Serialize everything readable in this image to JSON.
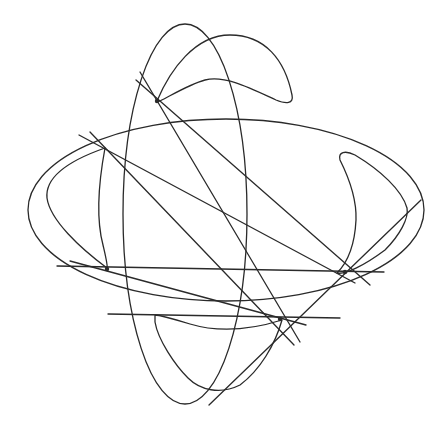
{
  "figure": {
    "width": 448,
    "height": 427,
    "stroke_color": "#2a2a2a",
    "background": "#ffffff"
  },
  "shapes": {
    "ellipses": [
      {
        "name": "vertical-ellipse",
        "cx": 185,
        "cy": 214,
        "rx": 62,
        "ry": 190
      },
      {
        "name": "horizontal-ellipse",
        "cx": 226,
        "cy": 210,
        "rx": 198,
        "ry": 91
      }
    ],
    "curves": [
      {
        "name": "top-crescent",
        "d": "M157,101 C170,70 195,35 230,35 C265,35 285,60 292,95 C294,104 286,104 276,100 C250,88 225,75 205,80 C190,84 172,95 160,101 Z"
      },
      {
        "name": "left-crescent",
        "d": "M107,268 C80,248 50,220 47,198 C45,178 65,162 105,148 C100,175 95,215 103,245 C106,258 108,266 107,268 Z"
      },
      {
        "name": "right-crescent",
        "d": "M337,273 C350,260 355,240 356,220 C357,195 345,170 340,160 C338,152 345,150 355,155 C380,170 402,190 407,208 C409,218 400,235 385,250 C365,265 345,275 337,273 Z"
      },
      {
        "name": "bottom-crescent",
        "d": "M155,315 C160,315 170,318 190,324 C220,333 250,330 282,320 C275,345 260,370 240,385 C220,395 200,390 188,378 C175,365 158,340 155,322 Z"
      }
    ],
    "lines": [
      {
        "name": "line-1",
        "x1": 140,
        "y1": 72,
        "x2": 300,
        "y2": 342
      },
      {
        "name": "line-2",
        "x1": 136,
        "y1": 80,
        "x2": 370,
        "y2": 285
      },
      {
        "name": "line-3",
        "x1": 79,
        "y1": 135,
        "x2": 355,
        "y2": 283
      },
      {
        "name": "line-4",
        "x1": 90,
        "y1": 132,
        "x2": 294,
        "y2": 345
      },
      {
        "name": "line-5",
        "x1": 57,
        "y1": 266,
        "x2": 384,
        "y2": 272
      },
      {
        "name": "line-6",
        "x1": 108,
        "y1": 314,
        "x2": 340,
        "y2": 318
      },
      {
        "name": "line-7",
        "x1": 70,
        "y1": 261,
        "x2": 306,
        "y2": 325
      },
      {
        "name": "line-8",
        "x1": 209,
        "y1": 405,
        "x2": 421,
        "y2": 200
      }
    ],
    "points": [
      {
        "name": "tangent-point-1",
        "cx": 157,
        "cy": 101
      },
      {
        "name": "tangent-point-2",
        "cx": 107,
        "cy": 269
      },
      {
        "name": "tangent-point-3",
        "cx": 345,
        "cy": 272
      },
      {
        "name": "tangent-point-4",
        "cx": 280,
        "cy": 319
      }
    ]
  }
}
